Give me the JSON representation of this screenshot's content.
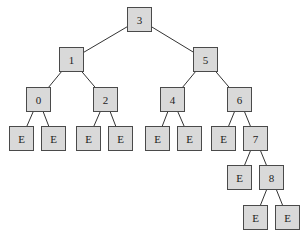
{
  "diagram": {
    "type": "binary-search-tree",
    "node_fill": "#d9d9d9",
    "node_border": "#4a4a4a",
    "edge_color": "#333333",
    "nodes": [
      {
        "id": "n3",
        "label": "3",
        "x": 127,
        "y": 7
      },
      {
        "id": "n1",
        "label": "1",
        "x": 59,
        "y": 47
      },
      {
        "id": "n5",
        "label": "5",
        "x": 193,
        "y": 47
      },
      {
        "id": "n0",
        "label": "0",
        "x": 26,
        "y": 87
      },
      {
        "id": "n2",
        "label": "2",
        "x": 93,
        "y": 87
      },
      {
        "id": "n4",
        "label": "4",
        "x": 160,
        "y": 87
      },
      {
        "id": "n6",
        "label": "6",
        "x": 227,
        "y": 87
      },
      {
        "id": "e0a",
        "label": "E",
        "x": 9,
        "y": 126
      },
      {
        "id": "e0b",
        "label": "E",
        "x": 41,
        "y": 126
      },
      {
        "id": "e2a",
        "label": "E",
        "x": 76,
        "y": 126
      },
      {
        "id": "e2b",
        "label": "E",
        "x": 108,
        "y": 126
      },
      {
        "id": "e4a",
        "label": "E",
        "x": 145,
        "y": 126
      },
      {
        "id": "e4b",
        "label": "E",
        "x": 177,
        "y": 126
      },
      {
        "id": "e6a",
        "label": "E",
        "x": 211,
        "y": 126
      },
      {
        "id": "n7",
        "label": "7",
        "x": 243,
        "y": 126
      },
      {
        "id": "e7a",
        "label": "E",
        "x": 227,
        "y": 165
      },
      {
        "id": "n8",
        "label": "8",
        "x": 259,
        "y": 165
      },
      {
        "id": "e8a",
        "label": "E",
        "x": 243,
        "y": 205
      },
      {
        "id": "e8b",
        "label": "E",
        "x": 275,
        "y": 205
      }
    ],
    "edges": [
      [
        "n3",
        "n1"
      ],
      [
        "n3",
        "n5"
      ],
      [
        "n1",
        "n0"
      ],
      [
        "n1",
        "n2"
      ],
      [
        "n5",
        "n4"
      ],
      [
        "n5",
        "n6"
      ],
      [
        "n0",
        "e0a"
      ],
      [
        "n0",
        "e0b"
      ],
      [
        "n2",
        "e2a"
      ],
      [
        "n2",
        "e2b"
      ],
      [
        "n4",
        "e4a"
      ],
      [
        "n4",
        "e4b"
      ],
      [
        "n6",
        "e6a"
      ],
      [
        "n6",
        "n7"
      ],
      [
        "n7",
        "e7a"
      ],
      [
        "n7",
        "n8"
      ],
      [
        "n8",
        "e8a"
      ],
      [
        "n8",
        "e8b"
      ]
    ]
  }
}
